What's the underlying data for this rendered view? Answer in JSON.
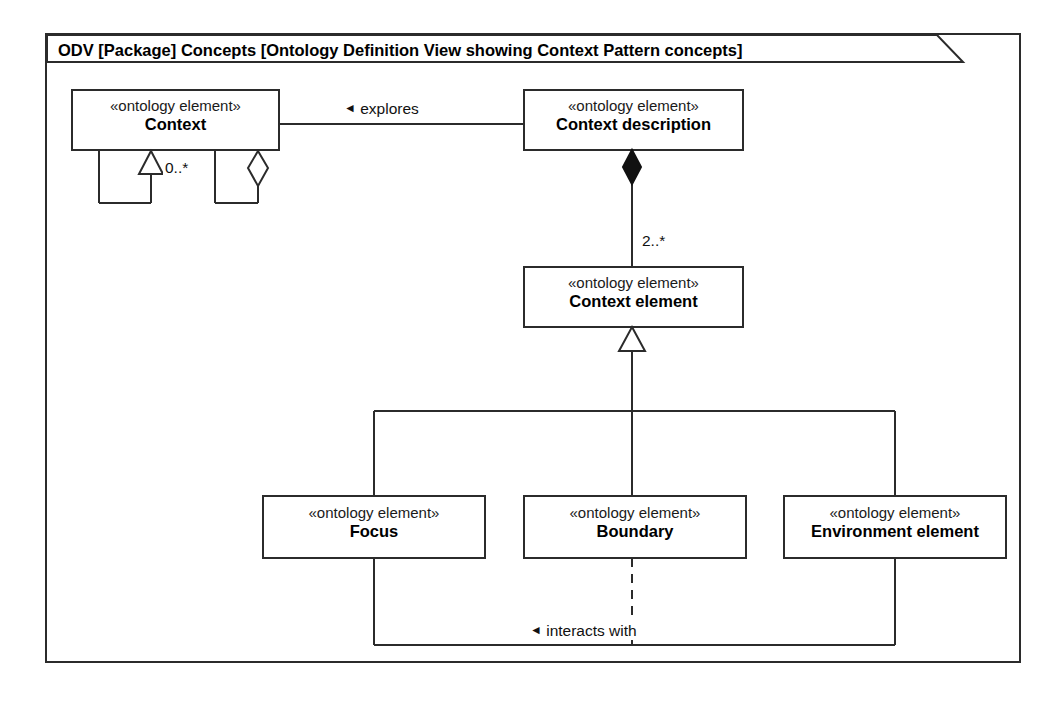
{
  "frame": {
    "name": "odv-package-frame",
    "title": "ODV [Package] Concepts [Ontology Definition View showing Context Pattern concepts]"
  },
  "diagram": {
    "type": "uml-class-diagram",
    "stereotype_text": "«ontology element»",
    "line_color": "#2b2b2b",
    "fill_color": "#ffffff",
    "text_color": "#000000"
  },
  "classes": [
    {
      "id": "context",
      "name": "Context",
      "stereotype": "«ontology element»"
    },
    {
      "id": "context-description",
      "name": "Context description",
      "stereotype": "«ontology element»"
    },
    {
      "id": "context-element",
      "name": "Context element",
      "stereotype": "«ontology element»"
    },
    {
      "id": "focus",
      "name": "Focus",
      "stereotype": "«ontology element»"
    },
    {
      "id": "boundary",
      "name": "Boundary",
      "stereotype": "«ontology element»"
    },
    {
      "id": "environment-element",
      "name": "Environment element",
      "stereotype": "«ontology element»"
    }
  ],
  "relationships": [
    {
      "id": "explores",
      "label": "explores",
      "marker": "◄",
      "kind": "association",
      "from": "context-description",
      "to": "context"
    },
    {
      "id": "context-generalization-self",
      "label": "",
      "kind": "generalization",
      "from": "context",
      "to": "context"
    },
    {
      "id": "context-aggregation-self",
      "label": "0..*",
      "kind": "aggregation",
      "from": "context",
      "to": "context"
    },
    {
      "id": "description-composition",
      "label": "2..*",
      "kind": "composition",
      "from": "context-description",
      "to": "context-element"
    },
    {
      "id": "element-generalization",
      "label": "",
      "kind": "generalization",
      "from": "context-element",
      "to": "context-element"
    },
    {
      "id": "interacts-with",
      "label": "interacts with",
      "marker": "◄",
      "kind": "association",
      "from": "environment-element",
      "to": "focus"
    }
  ],
  "multiplicities": {
    "context_self_aggregation": "0..*",
    "description_to_element": "2..*"
  },
  "edge_labels": {
    "explores": "explores",
    "interacts_with": "interacts with",
    "arrow_marker": "◄"
  }
}
